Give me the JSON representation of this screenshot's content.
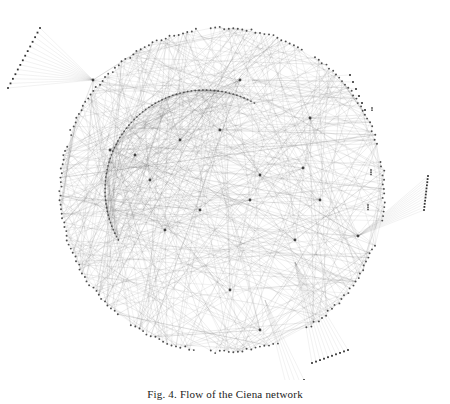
{
  "figure": {
    "caption": "Fig. 4. Flow of the Ciena network",
    "colors": {
      "background": "#ffffff",
      "edge": "#555555",
      "node": "#333333",
      "edge_opacity": 0.18
    },
    "layout": {
      "center_x": 222,
      "center_y": 190,
      "outer_radius": 162,
      "inner_arc": {
        "cx": 205,
        "cy": 190,
        "r": 100,
        "start_deg": 150,
        "end_deg": 300
      }
    },
    "outer_ring_segments": [
      {
        "start_deg": 200,
        "end_deg": 262
      },
      {
        "start_deg": 266,
        "end_deg": 300
      },
      {
        "start_deg": 305,
        "end_deg": 345
      },
      {
        "start_deg": 350,
        "end_deg": 372
      },
      {
        "start_deg": 20,
        "end_deg": 60
      },
      {
        "start_deg": 70,
        "end_deg": 95
      },
      {
        "start_deg": 100,
        "end_deg": 125
      },
      {
        "start_deg": 130,
        "end_deg": 196
      }
    ],
    "hubs": [
      {
        "x": 240,
        "y": 80
      },
      {
        "x": 93,
        "y": 80
      },
      {
        "x": 358,
        "y": 236
      },
      {
        "x": 295,
        "y": 240
      },
      {
        "x": 303,
        "y": 168
      },
      {
        "x": 310,
        "y": 118
      },
      {
        "x": 135,
        "y": 155
      },
      {
        "x": 180,
        "y": 140
      },
      {
        "x": 220,
        "y": 130
      },
      {
        "x": 260,
        "y": 175
      },
      {
        "x": 200,
        "y": 210
      },
      {
        "x": 165,
        "y": 230
      },
      {
        "x": 230,
        "y": 290
      },
      {
        "x": 260,
        "y": 330
      },
      {
        "x": 150,
        "y": 180
      },
      {
        "x": 250,
        "y": 200
      },
      {
        "x": 320,
        "y": 200
      },
      {
        "x": 110,
        "y": 150
      }
    ],
    "fans": [
      {
        "hub": [
          93,
          80
        ],
        "from": [
          40,
          28
        ],
        "to": [
          8,
          88
        ],
        "count": 14
      },
      {
        "hub": [
          358,
          236
        ],
        "from": [
          428,
          176
        ],
        "to": [
          424,
          210
        ],
        "count": 12
      },
      {
        "hub": [
          295,
          262
        ],
        "from": [
          348,
          350
        ],
        "to": [
          312,
          363
        ],
        "count": 10
      },
      {
        "hub": [
          265,
          300
        ],
        "from": [
          304,
          380
        ],
        "to": [
          286,
          384
        ],
        "count": 5
      },
      {
        "hub": [
          252,
          80
        ],
        "from": [
          350,
          75
        ],
        "to": [
          365,
          110
        ],
        "count": 6
      }
    ],
    "small_clusters": [
      {
        "x": 371,
        "y": 170,
        "n": 3
      },
      {
        "x": 368,
        "y": 205,
        "n": 3
      },
      {
        "x": 372,
        "y": 108,
        "n": 2
      }
    ],
    "edge_count": 620,
    "seed": 7
  }
}
